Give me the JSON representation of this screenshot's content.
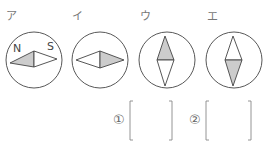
{
  "compasses": [
    {
      "label": "ア",
      "orientation": "horizontal",
      "shaded": "left",
      "markings": {
        "left": "N",
        "right": "S"
      }
    },
    {
      "label": "イ",
      "orientation": "horizontal",
      "shaded": "right"
    },
    {
      "label": "ウ",
      "orientation": "vertical",
      "shaded": "top"
    },
    {
      "label": "エ",
      "orientation": "vertical",
      "shaded": "bottom"
    }
  ],
  "answers": [
    {
      "number": "①",
      "value": ""
    },
    {
      "number": "②",
      "value": ""
    }
  ],
  "colors": {
    "stroke": "#444444",
    "shade": "#cccccc"
  }
}
